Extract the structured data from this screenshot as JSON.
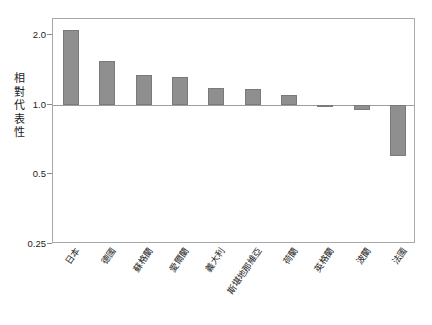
{
  "chart_data": {
    "type": "bar",
    "title": "",
    "subtitle": "",
    "xlabel": "",
    "ylabel": "相對代表性",
    "yscale": "log",
    "ylim": [
      0.25,
      2.35
    ],
    "baseline": 1.0,
    "grid": false,
    "legend": null,
    "y_ticks": [
      {
        "value": 2.0,
        "label": "2.0"
      },
      {
        "value": 1.0,
        "label": "1.0"
      },
      {
        "value": 0.5,
        "label": "0.5"
      },
      {
        "value": 0.25,
        "label": "0.25"
      }
    ],
    "categories": [
      "日本",
      "德國",
      "蘇格蘭",
      "愛爾蘭",
      "義大利",
      "斯堪地那維亞",
      "荷蘭",
      "英格蘭",
      "波蘭",
      "法國"
    ],
    "values": [
      2.1,
      1.55,
      1.35,
      1.32,
      1.18,
      1.17,
      1.1,
      0.98,
      0.95,
      0.6
    ],
    "bar_color": "#8f8f8f",
    "bar_edge_color": "#7a7a7a",
    "frame_color": "#a8a8a8",
    "baseline_color": "#9e9e9e",
    "text_color": "#1c1c1c",
    "background": "#ffffff"
  }
}
